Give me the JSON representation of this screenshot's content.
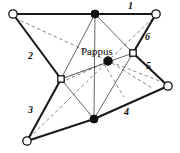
{
  "figure": {
    "center_label": {
      "text": "Pappus",
      "x": 81,
      "y": 47
    },
    "canvas": {
      "width": 180,
      "height": 153,
      "background": "#ffffff"
    },
    "colors": {
      "thick_edge": "#1a1a1a",
      "thin_edge": "#555555",
      "dashed_edge": "#6b6b6b",
      "node_stroke": "#111111",
      "node_fill_open": "#ffffff",
      "node_fill_solid": "#111111"
    },
    "edge_labels": [
      {
        "id": "label-1",
        "text": "1",
        "x": 128,
        "y": 1
      },
      {
        "id": "label-2",
        "text": "2",
        "x": 28,
        "y": 51
      },
      {
        "id": "label-3",
        "text": "3",
        "x": 28,
        "y": 105
      },
      {
        "id": "label-4",
        "text": "4",
        "x": 124,
        "y": 107
      },
      {
        "id": "label-5",
        "text": "5",
        "x": 146,
        "y": 61
      },
      {
        "id": "label-6",
        "text": "6",
        "x": 145,
        "y": 32
      }
    ],
    "nodes": [
      {
        "id": "node-top-left",
        "shape": "circle",
        "fill": "open",
        "x": 13,
        "y": 14,
        "r": 4.2
      },
      {
        "id": "node-top-center",
        "shape": "circle",
        "fill": "solid",
        "x": 95,
        "y": 14,
        "r": 4.0
      },
      {
        "id": "node-top-right",
        "shape": "circle",
        "fill": "open",
        "x": 156,
        "y": 14,
        "r": 4.2
      },
      {
        "id": "node-mid-left",
        "shape": "square",
        "fill": "open",
        "x": 61,
        "y": 79,
        "s": 6.4
      },
      {
        "id": "node-mid-right",
        "shape": "square",
        "fill": "open",
        "x": 133,
        "y": 53,
        "s": 6.4
      },
      {
        "id": "node-pappus",
        "shape": "circle",
        "fill": "solid",
        "x": 108,
        "y": 61,
        "r": 4.2
      },
      {
        "id": "node-bottom-left",
        "shape": "circle",
        "fill": "open",
        "x": 27,
        "y": 141,
        "r": 4.2
      },
      {
        "id": "node-bottom-center",
        "shape": "circle",
        "fill": "solid",
        "x": 94,
        "y": 119,
        "r": 4.0
      },
      {
        "id": "node-right",
        "shape": "circle",
        "fill": "open",
        "x": 168,
        "y": 86,
        "r": 4.2
      }
    ],
    "edges_thick": [
      {
        "id": "edge-1",
        "from": "node-top-left",
        "to": "node-top-center",
        "x1": 13,
        "y1": 14,
        "x2": 95,
        "y2": 14
      },
      {
        "id": "edge-1b",
        "from": "node-top-center",
        "to": "node-top-right",
        "x1": 95,
        "y1": 14,
        "x2": 156,
        "y2": 14
      },
      {
        "id": "edge-2",
        "from": "node-top-left",
        "to": "node-mid-left",
        "x1": 13,
        "y1": 14,
        "x2": 61,
        "y2": 79
      },
      {
        "id": "edge-3",
        "from": "node-mid-left",
        "to": "node-bottom-left",
        "x1": 61,
        "y1": 79,
        "x2": 27,
        "y2": 141
      },
      {
        "id": "edge-4",
        "from": "node-bottom-left",
        "to": "node-bottom-center",
        "x1": 27,
        "y1": 141,
        "x2": 94,
        "y2": 119
      },
      {
        "id": "edge-4b",
        "from": "node-bottom-center",
        "to": "node-right",
        "x1": 94,
        "y1": 119,
        "x2": 168,
        "y2": 86
      },
      {
        "id": "edge-5",
        "from": "node-mid-right",
        "to": "node-right",
        "x1": 133,
        "y1": 53,
        "x2": 168,
        "y2": 86
      },
      {
        "id": "edge-6",
        "from": "node-top-right",
        "to": "node-mid-right",
        "x1": 156,
        "y1": 14,
        "x2": 133,
        "y2": 53
      }
    ],
    "edges_thin": [
      {
        "id": "thin-a",
        "from": "node-top-center",
        "to": "node-mid-left",
        "x1": 95,
        "y1": 14,
        "x2": 61,
        "y2": 79
      },
      {
        "id": "thin-b",
        "from": "node-top-center",
        "to": "node-mid-right",
        "x1": 95,
        "y1": 14,
        "x2": 133,
        "y2": 53
      },
      {
        "id": "thin-c",
        "from": "node-mid-left",
        "to": "node-bottom-center",
        "x1": 61,
        "y1": 79,
        "x2": 94,
        "y2": 119
      },
      {
        "id": "thin-d",
        "from": "node-mid-right",
        "to": "node-bottom-center",
        "x1": 133,
        "y1": 53,
        "x2": 94,
        "y2": 119
      },
      {
        "id": "thin-e",
        "from": "node-top-center",
        "to": "node-bottom-center",
        "x1": 95,
        "y1": 14,
        "x2": 94,
        "y2": 119
      },
      {
        "id": "thin-f",
        "from": "node-mid-left",
        "to": "node-mid-right",
        "x1": 61,
        "y1": 79,
        "x2": 133,
        "y2": 53
      }
    ],
    "edges_dashed": [
      {
        "id": "dash-1",
        "from": "node-top-left",
        "to": "node-pappus",
        "x1": 15,
        "y1": 18,
        "x2": 108,
        "y2": 61
      },
      {
        "id": "dash-2",
        "from": "node-bottom-left",
        "to": "node-pappus",
        "x1": 29,
        "y1": 138,
        "x2": 108,
        "y2": 61
      },
      {
        "id": "dash-3",
        "from": "node-right",
        "to": "node-pappus",
        "x1": 165,
        "y1": 83,
        "x2": 108,
        "y2": 61
      },
      {
        "id": "dash-4",
        "from": "node-top-right",
        "to": "node-pappus",
        "x1": 153,
        "y1": 18,
        "x2": 108,
        "y2": 61
      },
      {
        "id": "dash-5",
        "from": "node-mid-left",
        "to": "node-pappus",
        "x1": 64,
        "y1": 78,
        "x2": 108,
        "y2": 61
      },
      {
        "id": "dash-6",
        "from": "node-pappus",
        "to": "node-lower",
        "x1": 108,
        "y1": 61,
        "x2": 122,
        "y2": 95
      }
    ]
  }
}
